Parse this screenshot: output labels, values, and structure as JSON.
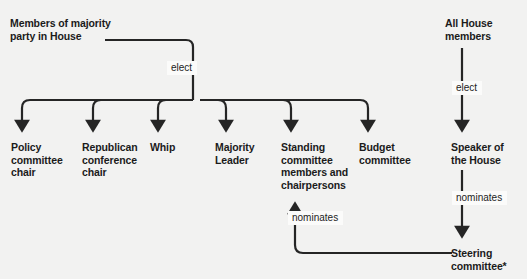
{
  "diagram": {
    "background_color": "#f2f2f1",
    "line_color": "#252525",
    "text_color": "#1b1b1b",
    "label_background": "#fbfbfa",
    "sources": {
      "majority_party": "Members of majority\nparty in House",
      "all_house": "All House\nmembers"
    },
    "edge_labels": {
      "elect_majority": "elect",
      "elect_speaker": "elect",
      "nominates_speaker": "nominates",
      "nominates_steering": "nominates"
    },
    "elected_positions": [
      {
        "label": "Policy\ncommittee\nchair"
      },
      {
        "label": "Republican\nconference\nchair"
      },
      {
        "label": "Whip"
      },
      {
        "label": "Majority\nLeader"
      },
      {
        "label": "Standing\ncommittee\nmembers and\nchairpersons"
      },
      {
        "label": "Budget\ncommittee"
      }
    ],
    "speaker": "Speaker of\nthe House",
    "steering": "Steering\ncommittee*"
  }
}
